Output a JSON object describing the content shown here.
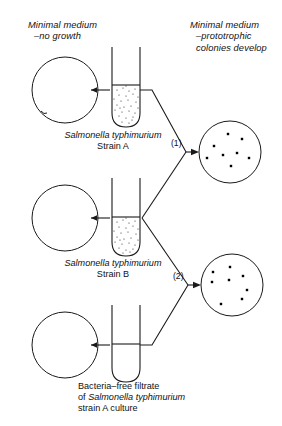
{
  "figure": {
    "title_left": "Minimal medium\n–no growth",
    "title_right": "Minimal medium\n–prototrophic\ncolonies develop"
  },
  "headers": {
    "left": {
      "line1": "Minimal medium",
      "line2": "–no growth"
    },
    "right": {
      "line1": "Minimal medium",
      "line2": "–prototrophic",
      "line3": "colonies develop"
    }
  },
  "captions": {
    "strain_a": {
      "species": "Salmonella typhimurium",
      "strain": "Strain A"
    },
    "strain_b": {
      "species": "Salmonella typhimurium",
      "strain": "Strain B"
    },
    "filtrate": {
      "line1": "Bacteria–free filtrate",
      "line2_prefix": "of ",
      "line2_species": "Salmonella typhimurium",
      "line3": "strain A culture"
    }
  },
  "result_labels": {
    "result_one": "(1)",
    "result_two": "(2)"
  },
  "plates": {
    "empty_plates": [
      {
        "name": "empty-plate-top",
        "cx": 65,
        "cy": 90,
        "r": 33
      },
      {
        "name": "empty-plate-middle",
        "cx": 65,
        "cy": 218,
        "r": 33
      },
      {
        "name": "empty-plate-bottom",
        "cx": 65,
        "cy": 345,
        "r": 33
      }
    ],
    "colony_plates": [
      {
        "name": "colony-plate-one",
        "cx": 230,
        "cy": 152,
        "r": 31,
        "colony_count": 8,
        "colonies": [
          {
            "x": 228,
            "y": 134
          },
          {
            "x": 242,
            "y": 139
          },
          {
            "x": 214,
            "y": 146
          },
          {
            "x": 237,
            "y": 153
          },
          {
            "x": 223,
            "y": 155
          },
          {
            "x": 207,
            "y": 158
          },
          {
            "x": 249,
            "y": 158
          },
          {
            "x": 231,
            "y": 166
          }
        ]
      },
      {
        "name": "colony-plate-two",
        "cx": 232,
        "cy": 285,
        "r": 31,
        "colony_count": 8,
        "colonies": [
          {
            "x": 230,
            "y": 267
          },
          {
            "x": 213,
            "y": 272
          },
          {
            "x": 243,
            "y": 276
          },
          {
            "x": 229,
            "y": 280
          },
          {
            "x": 212,
            "y": 282
          },
          {
            "x": 247,
            "y": 290
          },
          {
            "x": 242,
            "y": 299
          },
          {
            "x": 221,
            "y": 304
          }
        ]
      }
    ]
  },
  "tubes": [
    {
      "name": "tube-strain-a",
      "x": 112,
      "top": 47,
      "width": 28,
      "bottom": 127,
      "fill_level": 85,
      "contents": "stippled-culture"
    },
    {
      "name": "tube-strain-b",
      "x": 112,
      "top": 178,
      "width": 28,
      "bottom": 256,
      "fill_level": 217,
      "contents": "stippled-culture"
    },
    {
      "name": "tube-filtrate",
      "x": 112,
      "top": 305,
      "width": 28,
      "bottom": 382,
      "fill_level": 344,
      "contents": "clear-filtrate"
    }
  ],
  "colors": {
    "ink": "#1a1a1a",
    "background": "#ffffff",
    "colony": "#000000"
  }
}
